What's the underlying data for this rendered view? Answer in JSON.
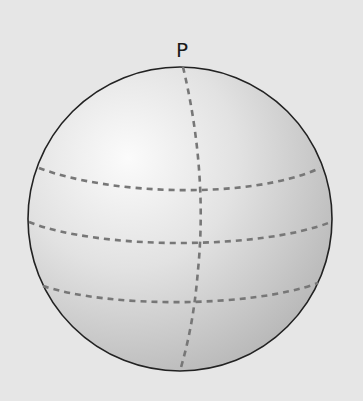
{
  "diagram": {
    "pole_label": "P",
    "elements": [
      {
        "name": "sphere",
        "type": "circle"
      },
      {
        "name": "meridian",
        "type": "dashed-curve",
        "passes_through": "P"
      },
      {
        "name": "latitude-lines",
        "type": "dashed-curve",
        "count": 3
      }
    ],
    "colors": {
      "background": "#e6e6e6",
      "sphere_highlight": "#fafafa",
      "sphere_shadow": "#b8b8b8",
      "outline": "#222222",
      "dashes": "#777777"
    }
  }
}
